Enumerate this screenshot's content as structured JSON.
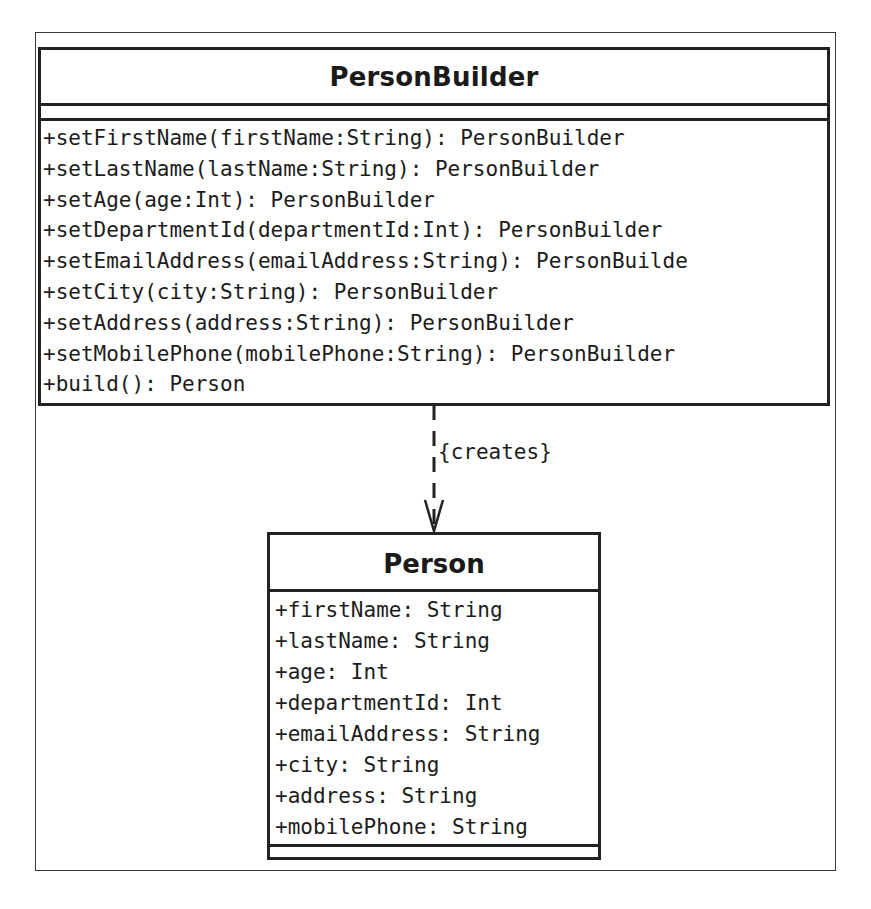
{
  "diagram": {
    "type": "UML class diagram",
    "classes": [
      {
        "name": "PersonBuilder",
        "attributes": [],
        "methods": [
          "+setFirstName(firstName:String): PersonBuilder",
          "+setLastName(lastName:String): PersonBuilder",
          "+setAge(age:Int): PersonBuilder",
          "+setDepartmentId(departmentId:Int): PersonBuilder",
          "+setEmailAddress(emailAddress:String): PersonBuilde",
          "+setCity(city:String): PersonBuilder",
          "+setAddress(address:String): PersonBuilder",
          "+setMobilePhone(mobilePhone:String): PersonBuilder",
          "+build(): Person"
        ]
      },
      {
        "name": "Person",
        "attributes": [
          "+firstName: String",
          "+lastName: String",
          "+age: Int",
          "+departmentId: Int",
          "+emailAddress: String",
          "+city: String",
          "+address: String",
          "+mobilePhone: String"
        ],
        "methods": []
      }
    ],
    "relations": [
      {
        "from": "PersonBuilder",
        "to": "Person",
        "kind": "dependency",
        "line_style": "dashed",
        "arrowhead": "open",
        "label": "{creates}"
      }
    ],
    "colors": {
      "line": "#222222",
      "text": "#1a1a1a",
      "background": "#ffffff"
    }
  }
}
